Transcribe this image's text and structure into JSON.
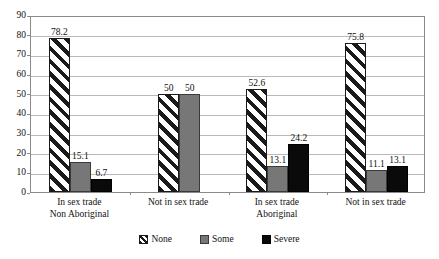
{
  "chart_data": {
    "type": "bar",
    "title": "",
    "subtitle": "",
    "xlabel": "",
    "ylabel": "",
    "ylim": [
      0,
      90
    ],
    "ytick_step": 10,
    "ytick_labels": [
      "90",
      "80",
      "70",
      "60",
      "50",
      "40",
      "30",
      "20",
      "10",
      "0"
    ],
    "grid": true,
    "legend_position": "bottom",
    "categories": [
      "In sex trade\nNon Aboriginal",
      "Not in sex trade",
      "In sex trade\nAboriginal",
      "Not in sex trade"
    ],
    "category_lines": [
      {
        "line1": "In sex trade",
        "line2": "Non Aboriginal"
      },
      {
        "line1": "Not in sex trade",
        "line2": ""
      },
      {
        "line1": "In sex trade",
        "line2": "Aboriginal"
      },
      {
        "line1": "Not in sex trade",
        "line2": ""
      }
    ],
    "series": [
      {
        "name": "None",
        "pattern": "diagonal-hatch",
        "color": "#ffffff",
        "values": [
          78.2,
          50,
          52.6,
          75.8
        ]
      },
      {
        "name": "Some",
        "pattern": "solid",
        "color": "#777777",
        "values": [
          15.1,
          50,
          13.1,
          11.1
        ]
      },
      {
        "name": "Severe",
        "pattern": "solid",
        "color": "#0a0a0a",
        "values": [
          6.7,
          null,
          24.2,
          13.1
        ]
      }
    ],
    "data_labels": [
      [
        "78.2",
        "15.1",
        "6.7"
      ],
      [
        "50",
        "50",
        ""
      ],
      [
        "52.6",
        "13.1",
        "24.2"
      ],
      [
        "75.8",
        "11.1",
        "13.1"
      ]
    ]
  },
  "legend": {
    "items": [
      {
        "label": "None"
      },
      {
        "label": "Some"
      },
      {
        "label": "Severe"
      }
    ]
  },
  "colors": {
    "axis": "#8a8a8a",
    "grid": "#b9b9b9",
    "text": "#111111",
    "series_some": "#777777",
    "series_severe": "#0a0a0a",
    "series_none_fill": "#ffffff"
  }
}
